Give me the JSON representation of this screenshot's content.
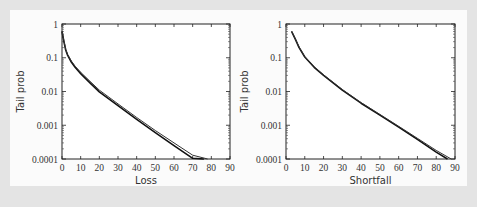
{
  "chart_data": [
    {
      "type": "line",
      "title": "",
      "xlabel": "Loss",
      "ylabel": "Tail prob",
      "xlim": [
        0,
        90
      ],
      "ylim": [
        0.0001,
        1
      ],
      "yscale": "log",
      "x_ticks": [
        "0",
        "10",
        "20",
        "30",
        "40",
        "50",
        "60",
        "70",
        "80",
        "90"
      ],
      "y_ticks": [
        "1",
        "0.1",
        "0.01",
        "0.001",
        "0.0001"
      ],
      "grid": false,
      "legend": null,
      "series": [
        {
          "name": "curve-1",
          "x": [
            0,
            1,
            2,
            3,
            5,
            7,
            10,
            15,
            20,
            30,
            40,
            50,
            60,
            70,
            76
          ],
          "values": [
            0.6,
            0.3,
            0.17,
            0.12,
            0.075,
            0.052,
            0.034,
            0.018,
            0.0098,
            0.0038,
            0.0015,
            0.0006,
            0.00025,
            0.000105,
            0.0001
          ]
        },
        {
          "name": "curve-2",
          "x": [
            0,
            1,
            2,
            3,
            5,
            7,
            10,
            15,
            20,
            30,
            40,
            50,
            60,
            70,
            78
          ],
          "values": [
            0.62,
            0.32,
            0.18,
            0.125,
            0.08,
            0.056,
            0.037,
            0.02,
            0.011,
            0.0043,
            0.0017,
            0.0007,
            0.0003,
            0.00013,
            0.0001
          ]
        }
      ]
    },
    {
      "type": "line",
      "title": "",
      "xlabel": "Shortfall",
      "ylabel": "Tail prob",
      "xlim": [
        0,
        90
      ],
      "ylim": [
        0.0001,
        1
      ],
      "yscale": "log",
      "x_ticks": [
        "0",
        "10",
        "20",
        "30",
        "40",
        "50",
        "60",
        "70",
        "80",
        "90"
      ],
      "y_ticks": [
        "1",
        "0.1",
        "0.01",
        "0.001",
        "0.0001"
      ],
      "grid": false,
      "legend": null,
      "series": [
        {
          "name": "curve-1",
          "x": [
            3,
            5,
            7,
            10,
            15,
            20,
            30,
            40,
            50,
            60,
            70,
            80,
            86
          ],
          "values": [
            0.6,
            0.35,
            0.2,
            0.105,
            0.052,
            0.03,
            0.011,
            0.0045,
            0.002,
            0.00088,
            0.00038,
            0.00016,
            0.0001
          ]
        },
        {
          "name": "curve-2",
          "x": [
            3,
            5,
            7,
            10,
            15,
            20,
            30,
            40,
            50,
            60,
            70,
            80,
            88
          ],
          "values": [
            0.62,
            0.36,
            0.21,
            0.108,
            0.054,
            0.031,
            0.0115,
            0.0047,
            0.0021,
            0.00093,
            0.00041,
            0.00018,
            0.0001
          ]
        }
      ]
    }
  ],
  "plots": [
    {
      "xlabel": "Loss",
      "ylabel": "Tail prob"
    },
    {
      "xlabel": "Shortfall",
      "ylabel": "Tail prob"
    }
  ]
}
